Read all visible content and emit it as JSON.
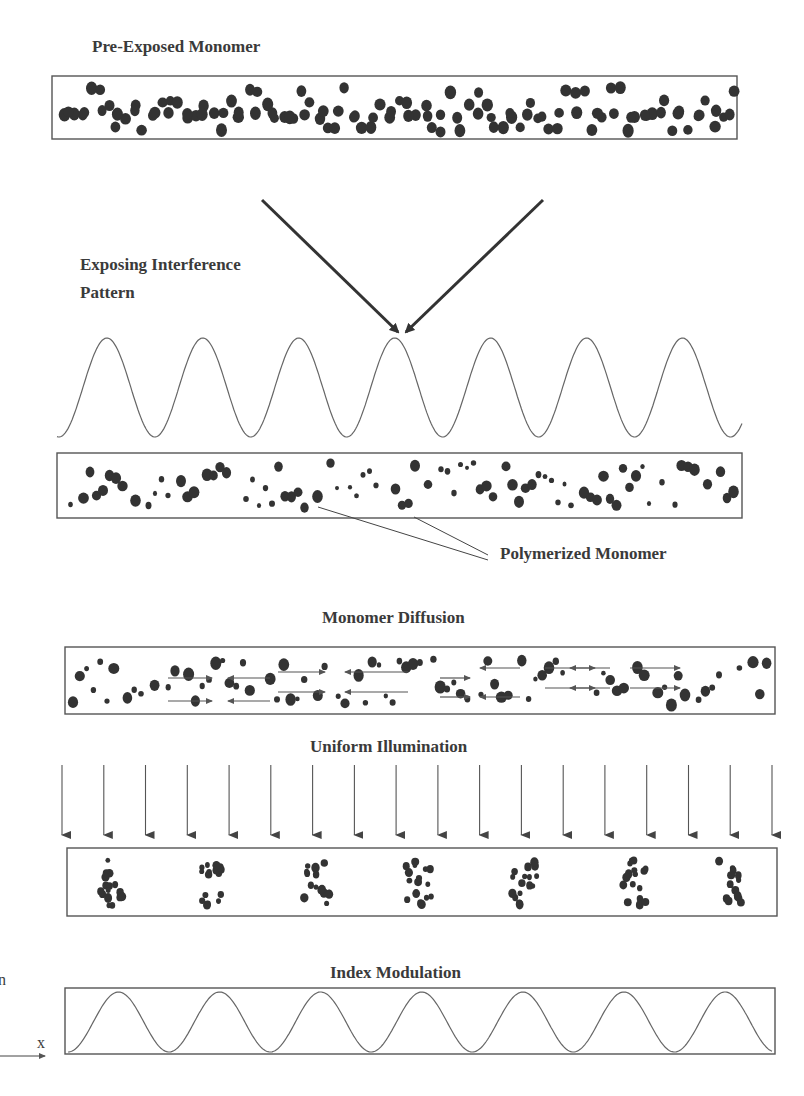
{
  "diagram": {
    "title_stage1": "Pre-Exposed Monomer",
    "title_stage2_line1": "Exposing Interference",
    "title_stage2_line2": "Pattern",
    "callout_label": "Polymerized Monomer",
    "title_stage3": "Monomer Diffusion",
    "title_stage4": "Uniform Illumination",
    "title_stage5": "Index Modulation",
    "axis_y_label": "n",
    "axis_x_label": "x",
    "interference_periods": 7,
    "index_modulation_periods": 7,
    "illumination_arrow_count": 18,
    "polymer_cluster_count": 7,
    "colors": {
      "ink": "#333333",
      "line": "#555555",
      "background": "#ffffff"
    }
  }
}
